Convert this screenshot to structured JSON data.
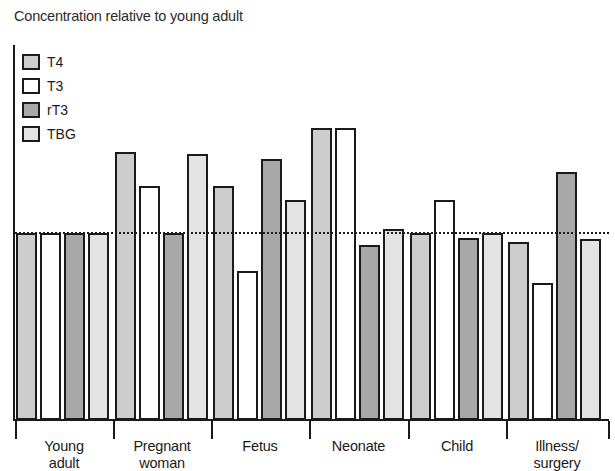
{
  "chart_data": {
    "type": "bar",
    "title": "Concentration relative to young adult",
    "xlabel": "",
    "ylabel": "Concentration relative to young adult",
    "grid": false,
    "legend_position": "top-left",
    "reference_line": {
      "value": 1.0,
      "style": "dotted",
      "label": "young adult level"
    },
    "ylim": [
      0,
      2.1
    ],
    "categories": [
      "Young adult",
      "Pregnant woman",
      "Fetus",
      "Neonate",
      "Child",
      "Illness/ surgery"
    ],
    "series": [
      {
        "name": "T4",
        "color": "#cdcdcd",
        "values": [
          1.0,
          1.65,
          1.38,
          1.85,
          1.0,
          0.93
        ]
      },
      {
        "name": "T3",
        "color": "#ffffff",
        "values": [
          1.0,
          1.38,
          0.69,
          1.85,
          1.27,
          0.6
        ]
      },
      {
        "name": "rT3",
        "color": "#a8a8a8",
        "values": [
          1.0,
          1.0,
          1.6,
          0.9,
          0.96,
          1.49
        ]
      },
      {
        "name": "TBG",
        "color": "#e3e3e3",
        "values": [
          1.0,
          1.64,
          1.27,
          1.03,
          1.0,
          0.95
        ]
      }
    ]
  },
  "chart": {
    "title": "Concentration relative to young adult",
    "legend": [
      {
        "key": "t4",
        "label": "T4",
        "swatch": "#cdcdcd"
      },
      {
        "key": "t3",
        "label": "T3",
        "swatch": "#ffffff"
      },
      {
        "key": "rt3",
        "label": "rT3",
        "swatch": "#a8a8a8"
      },
      {
        "key": "tbg",
        "label": "TBG",
        "swatch": "#e3e3e3"
      }
    ],
    "groups": [
      {
        "label_line1": "Young",
        "label_line2": "adult"
      },
      {
        "label_line1": "Pregnant",
        "label_line2": "woman"
      },
      {
        "label_line1": "Fetus",
        "label_line2": ""
      },
      {
        "label_line1": "Neonate",
        "label_line2": ""
      },
      {
        "label_line1": "Child",
        "label_line2": ""
      },
      {
        "label_line1": "Illness/",
        "label_line2": "surgery"
      }
    ]
  }
}
